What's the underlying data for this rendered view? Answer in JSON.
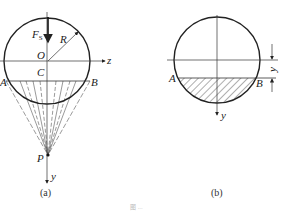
{
  "figure_a": {
    "caption": "(a)",
    "labels": {
      "force": "F",
      "force_sub": "S",
      "radius": "R",
      "origin": "O",
      "centroid": "C",
      "point_a": "A",
      "point_b": "B",
      "pole": "P",
      "z_axis": "z",
      "y_axis": "y"
    }
  },
  "figure_b": {
    "caption": "(b)",
    "labels": {
      "point_a": "A",
      "point_b": "B",
      "dimension": "y",
      "y_axis": "y"
    }
  },
  "footer": {
    "caption": "图 ..."
  },
  "colors": {
    "stroke": "#222222",
    "thin": "#444444"
  }
}
